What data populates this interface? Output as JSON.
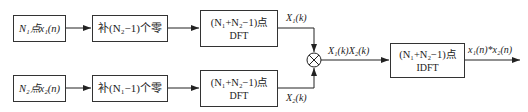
{
  "diagram": {
    "row1": {
      "input": "N₁点x₁(n)",
      "pad": "补(N₂−1)个零",
      "dft_line1": "(N₁+N₂−1)点",
      "dft_line2": "DFT",
      "output_label": "X₁(k)"
    },
    "row2": {
      "input": "N₂点x₂(n)",
      "pad": "补(N₁−1)个零",
      "dft_line1": "(N₁+N₂−1)点",
      "dft_line2": "DFT",
      "output_label": "X₂(k)"
    },
    "multiplier_symbol": "⊗",
    "product_label": "X₁(k)X₂(k)",
    "idft_line1": "(N₁+N₂−1)点",
    "idft_line2": "IDFT",
    "result_label": "x₁(n)*x₂(n)"
  }
}
